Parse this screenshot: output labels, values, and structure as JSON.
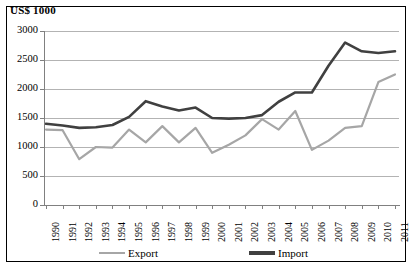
{
  "chart_data": {
    "type": "line",
    "title": "US$ 1000",
    "subtitle": "",
    "xlabel": "",
    "ylabel": "US$ 1000",
    "ylim": [
      0,
      3000
    ],
    "ytick_step": 500,
    "yticks": [
      3000,
      2500,
      2000,
      1500,
      1000,
      500,
      0
    ],
    "grid": true,
    "grid_axis": "y",
    "legend_position": "bottom",
    "categories": [
      "1990",
      "1991",
      "1992",
      "1993",
      "1994",
      "1995",
      "1996",
      "1997",
      "1998",
      "1999",
      "2000",
      "2001",
      "2002",
      "2003",
      "2004",
      "2005",
      "2006",
      "2007",
      "2008",
      "2009",
      "2010",
      "2011"
    ],
    "x": [
      1990,
      1991,
      1992,
      1993,
      1994,
      1995,
      1996,
      1997,
      1998,
      1999,
      2000,
      2001,
      2002,
      2003,
      2004,
      2005,
      2006,
      2007,
      2008,
      2009,
      2010,
      2011
    ],
    "series": [
      {
        "name": "Export",
        "color": "#a6a6a6",
        "values": [
          1300,
          1290,
          790,
          1000,
          990,
          1300,
          1080,
          1360,
          1080,
          1330,
          900,
          1040,
          1200,
          1480,
          1300,
          1620,
          950,
          1110,
          1330,
          1360,
          2120,
          2250
        ]
      },
      {
        "name": "Import",
        "color": "#404040",
        "values": [
          1400,
          1370,
          1330,
          1340,
          1380,
          1520,
          1790,
          1700,
          1630,
          1680,
          1500,
          1490,
          1500,
          1550,
          1780,
          1940,
          1940,
          2400,
          2800,
          2650,
          2620,
          2650
        ]
      }
    ]
  },
  "legend": {
    "items": [
      {
        "label": "Export",
        "color": "#a6a6a6"
      },
      {
        "label": "Import",
        "color": "#404040"
      }
    ]
  }
}
